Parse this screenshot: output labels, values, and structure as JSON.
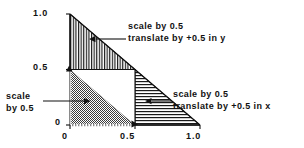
{
  "figure": {
    "background_color": "#ffffff",
    "ink_color": "#111111"
  },
  "axes": {
    "x_ticks": [
      {
        "value": 0,
        "label": "0"
      },
      {
        "value": 0.5,
        "label": "0.5"
      },
      {
        "value": 1.0,
        "label": "1.0"
      }
    ],
    "y_ticks": [
      {
        "value": 0,
        "label": "0"
      },
      {
        "value": 0.5,
        "label": "0.5"
      },
      {
        "value": 1.0,
        "label": "1.0"
      }
    ],
    "xlim": [
      0,
      1.0
    ],
    "ylim": [
      0,
      1.0
    ],
    "xlabel": "",
    "ylabel": ""
  },
  "annotations": {
    "top": {
      "line1": "scale by 0.5",
      "line2": "translate by +0.5 in y",
      "points_to": "upper-triangle"
    },
    "right": {
      "line1": "scale by 0.5",
      "line2": "translate by +0.5 in x",
      "points_to": "right-triangle"
    },
    "left": {
      "line1": "scale",
      "line2": "by 0.5",
      "points_to": "lower-left-triangle"
    }
  },
  "regions": [
    {
      "name": "upper-triangle",
      "fill": "vertical-hatch",
      "vertices_data": [
        [
          0,
          0.5
        ],
        [
          0,
          1.0
        ],
        [
          0.5,
          0.5
        ]
      ]
    },
    {
      "name": "lower-left-triangle",
      "fill": "stipple-dots",
      "vertices_data": [
        [
          0,
          0
        ],
        [
          0,
          0.5
        ],
        [
          0.5,
          0
        ]
      ]
    },
    {
      "name": "right-triangle",
      "fill": "horizontal-hatch",
      "vertices_data": [
        [
          0.5,
          0
        ],
        [
          0.5,
          0.5
        ],
        [
          1.0,
          0
        ]
      ]
    },
    {
      "name": "center-empty-triangle",
      "fill": "none",
      "vertices_data": [
        [
          0,
          0.5
        ],
        [
          0.5,
          0.5
        ],
        [
          0.5,
          0
        ]
      ]
    }
  ],
  "markers": [
    {
      "name": "y-half-marker",
      "glyph": "up-triangle",
      "at_data": [
        0,
        0.5
      ]
    },
    {
      "name": "x-half-marker",
      "glyph": "right-triangle",
      "at_data": [
        0.5,
        0
      ]
    }
  ]
}
